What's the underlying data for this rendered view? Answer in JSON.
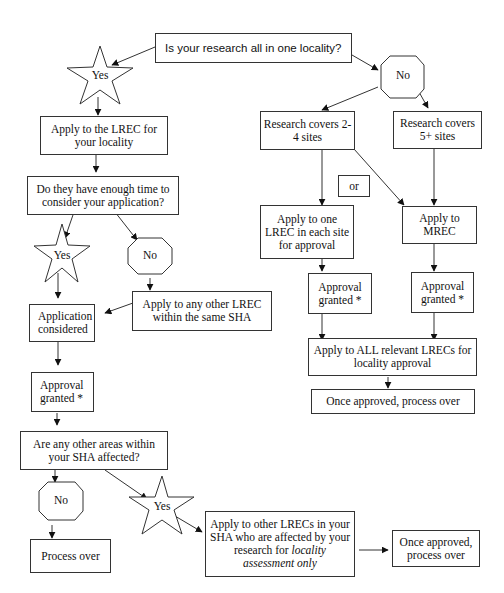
{
  "nodes": {
    "q_locality": "Is your research all in one locality?",
    "yes1": "Yes",
    "no1": "No",
    "apply_lrec_local": "Apply to the LREC for your locality",
    "q_time": "Do they have enough time to consider your application?",
    "yes2": "Yes",
    "no2": "No",
    "apply_other_lrec": "Apply to any other LREC within the same SHA",
    "app_considered": "Application considered",
    "approval1": "Approval granted *",
    "q_other_areas": "Are any other areas within your SHA affected?",
    "no3": "No",
    "yes3": "Yes",
    "process_over": "Process over",
    "apply_other_lrecs_line1": "Apply to other LRECs in your SHA who are affected by your research for",
    "apply_other_lrecs_italic": "locality assessment only",
    "once_approved_2": "Once approved, process over",
    "research_2_4": "Research covers 2-4 sites",
    "research_5": "Research covers 5+ sites",
    "or": "or",
    "apply_one_lrec": "Apply to one LREC in each site for approval",
    "apply_mrec": "Apply to MREC",
    "approval2": "Approval granted *",
    "approval3": "Approval granted *",
    "apply_all_lrecs": "Apply to ALL relevant LRECs for locality approval",
    "once_approved_1": "Once approved, process over"
  }
}
